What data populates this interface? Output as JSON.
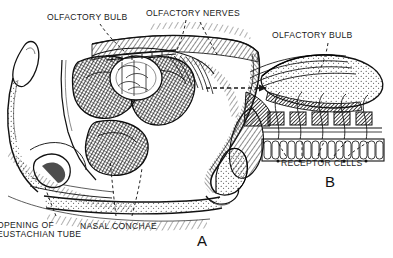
{
  "figure": {
    "kind": "anatomical-illustration",
    "style": "vintage black ink line engraving with cross-hatching on white",
    "width": 393,
    "height": 258,
    "ink_color": "#1a1a1a",
    "background_color": "#ffffff"
  },
  "labels": {
    "olfactory_bulb_a": "OLFACTORY BULB",
    "olfactory_nerves": "OLFACTORY NERVES",
    "olfactory_bulb_b": "OLFACTORY BULB",
    "receptor_cells": "RECEPTOR CELLS",
    "nasal_conchae": "NASAL CONCHAE",
    "opening_of_eustachian_tube_line1": "OPENING OF",
    "opening_of_eustachian_tube_line2": "EUSTACHIAN TUBE"
  },
  "panels": {
    "a": {
      "letter": "A",
      "description": "Mid-sagittal section through the nasal cavity showing the three nasal conchae, olfactory bulb above the cribriform plate, nose tip and nostril, palate and nasopharynx with the opening of the Eustachian tube."
    },
    "b": {
      "letter": "B",
      "description": "Magnified detail of the olfactory bulb, olfactory nerve fibers passing through the cribriform plate, and the olfactory epithelium containing receptor cells."
    }
  },
  "connector": {
    "type": "dashed-arrow",
    "from_panel": "A",
    "to_panel": "B",
    "meaning": "magnified region"
  },
  "leader_lines": [
    {
      "label": "olfactory_bulb_a",
      "style": "dashed"
    },
    {
      "label": "olfactory_nerves",
      "style": "dashed"
    },
    {
      "label": "olfactory_bulb_b",
      "style": "dashed"
    },
    {
      "label": "receptor_cells",
      "style": "dashed"
    },
    {
      "label": "nasal_conchae",
      "style": "dashed"
    },
    {
      "label": "opening_of_eustachian_tube",
      "style": "dashed"
    }
  ]
}
